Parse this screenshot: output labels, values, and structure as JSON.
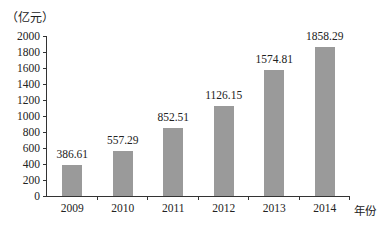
{
  "chart_data": {
    "type": "bar",
    "title": "",
    "xlabel": "年份",
    "ylabel": "（亿元）",
    "categories": [
      "2009",
      "2010",
      "2011",
      "2012",
      "2013",
      "2014"
    ],
    "values": [
      386.61,
      557.29,
      852.51,
      1126.15,
      1574.81,
      1858.29
    ],
    "value_labels": [
      "386.61",
      "557.29",
      "852.51",
      "1126.15",
      "1574.81",
      "1858.29"
    ],
    "ylim": [
      0,
      2000
    ],
    "yticks": [
      "0",
      "200",
      "400",
      "600",
      "800",
      "1000",
      "1200",
      "1400",
      "1600",
      "1800",
      "2000"
    ],
    "grid": false,
    "legend": null,
    "bar_color": "#9a9a9a"
  }
}
